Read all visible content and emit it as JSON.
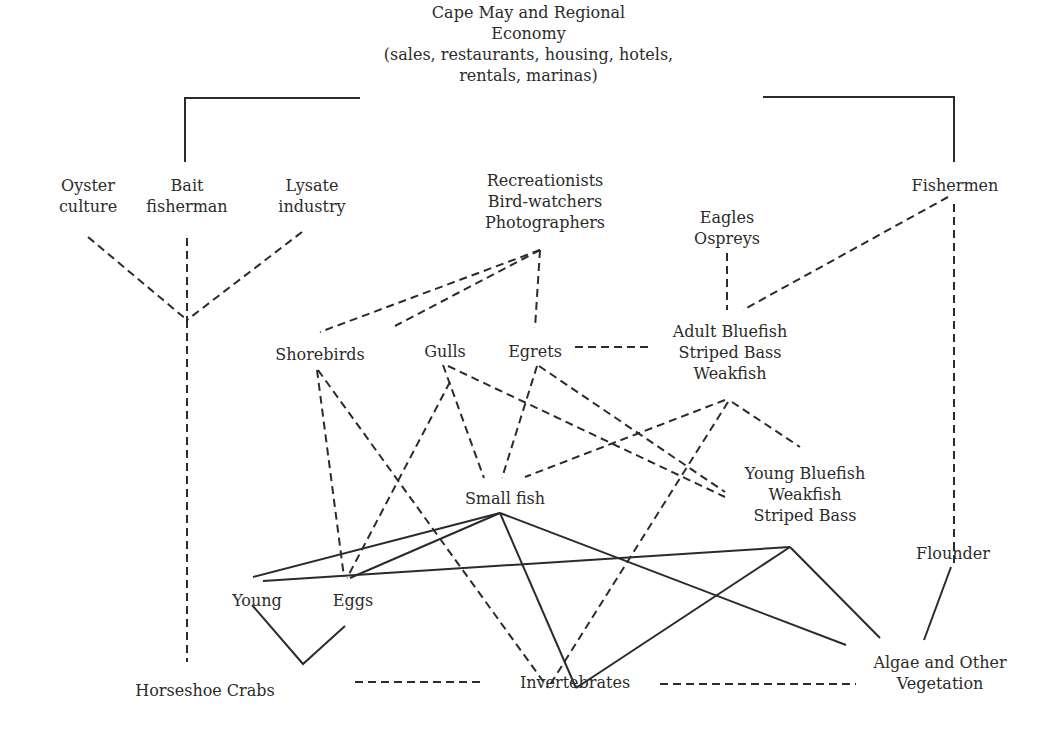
{
  "diagram": {
    "nodes": {
      "economy": {
        "lines": [
          "Cape May and Regional",
          "Economy",
          "(sales, restaurants, housing, hotels,",
          "rentals, marinas)"
        ]
      },
      "oyster": {
        "lines": [
          "Oyster",
          "culture"
        ]
      },
      "bait": {
        "lines": [
          "Bait",
          "fisherman"
        ]
      },
      "lysate": {
        "lines": [
          "Lysate",
          "industry"
        ]
      },
      "recreation": {
        "lines": [
          "Recreationists",
          "Bird-watchers",
          "Photographers"
        ]
      },
      "fishermen": {
        "lines": [
          "Fishermen"
        ]
      },
      "eagles": {
        "lines": [
          "Eagles",
          "Ospreys"
        ]
      },
      "shorebirds": {
        "lines": [
          "Shorebirds"
        ]
      },
      "gulls": {
        "lines": [
          "Gulls"
        ]
      },
      "egrets": {
        "lines": [
          "Egrets"
        ]
      },
      "adult_fish": {
        "lines": [
          "Adult Bluefish",
          "Striped Bass",
          "Weakfish"
        ]
      },
      "young_fish": {
        "lines": [
          "Young Bluefish",
          "Weakfish",
          "Striped Bass"
        ]
      },
      "small_fish": {
        "lines": [
          "Small fish"
        ]
      },
      "flounder": {
        "lines": [
          "Flounder"
        ]
      },
      "young": {
        "lines": [
          "Young"
        ]
      },
      "eggs": {
        "lines": [
          "Eggs"
        ]
      },
      "horseshoe": {
        "lines": [
          "Horseshoe Crabs"
        ]
      },
      "invertebrates": {
        "lines": [
          "Invertebrates"
        ]
      },
      "algae": {
        "lines": [
          "Algae and Other",
          "Vegetation"
        ]
      }
    },
    "edges": [
      {
        "type": "solid",
        "points": [
          [
            360,
            98
          ],
          [
            185,
            98
          ],
          [
            185,
            162
          ]
        ]
      },
      {
        "type": "solid",
        "points": [
          [
            763,
            97
          ],
          [
            954,
            97
          ],
          [
            954,
            162
          ]
        ]
      },
      {
        "type": "dash",
        "points": [
          [
            88,
            237
          ],
          [
            187,
            320
          ]
        ]
      },
      {
        "type": "dash",
        "points": [
          [
            187,
            238
          ],
          [
            187,
            320
          ]
        ]
      },
      {
        "type": "dash",
        "points": [
          [
            302,
            232
          ],
          [
            187,
            320
          ]
        ]
      },
      {
        "type": "dash",
        "points": [
          [
            187,
            320
          ],
          [
            187,
            662
          ]
        ]
      },
      {
        "type": "dash",
        "points": [
          [
            540,
            250
          ],
          [
            320,
            332
          ]
        ]
      },
      {
        "type": "dash",
        "points": [
          [
            540,
            250
          ],
          [
            395,
            326
          ]
        ]
      },
      {
        "type": "dash",
        "points": [
          [
            540,
            250
          ],
          [
            535,
            328
          ]
        ]
      },
      {
        "type": "dash",
        "points": [
          [
            727,
            253
          ],
          [
            727,
            310
          ]
        ]
      },
      {
        "type": "dash",
        "points": [
          [
            948,
            197
          ],
          [
            743,
            310
          ]
        ]
      },
      {
        "type": "dash",
        "points": [
          [
            954,
            204
          ],
          [
            954,
            568
          ]
        ]
      },
      {
        "type": "dash",
        "points": [
          [
            575,
            347
          ],
          [
            650,
            347
          ]
        ]
      },
      {
        "type": "dash",
        "points": [
          [
            317,
            370
          ],
          [
            344,
            577
          ]
        ]
      },
      {
        "type": "dash",
        "points": [
          [
            318,
            370
          ],
          [
            548,
            688
          ]
        ]
      },
      {
        "type": "dash",
        "points": [
          [
            450,
            382
          ],
          [
            347,
            578
          ]
        ]
      },
      {
        "type": "dash",
        "points": [
          [
            443,
            365
          ],
          [
            484,
            478
          ]
        ]
      },
      {
        "type": "dash",
        "points": [
          [
            448,
            366
          ],
          [
            725,
            497
          ]
        ]
      },
      {
        "type": "dash",
        "points": [
          [
            537,
            366
          ],
          [
            502,
            478
          ]
        ]
      },
      {
        "type": "dash",
        "points": [
          [
            539,
            366
          ],
          [
            725,
            492
          ]
        ]
      },
      {
        "type": "dash",
        "points": [
          [
            725,
            400
          ],
          [
            525,
            477
          ]
        ]
      },
      {
        "type": "dash",
        "points": [
          [
            728,
            402
          ],
          [
            548,
            688
          ]
        ]
      },
      {
        "type": "dash",
        "points": [
          [
            732,
            402
          ],
          [
            800,
            447
          ]
        ]
      },
      {
        "type": "solid",
        "points": [
          [
            500,
            513
          ],
          [
            253,
            577
          ]
        ]
      },
      {
        "type": "solid",
        "points": [
          [
            500,
            513
          ],
          [
            350,
            578
          ]
        ]
      },
      {
        "type": "solid",
        "points": [
          [
            500,
            513
          ],
          [
            576,
            688
          ]
        ]
      },
      {
        "type": "solid",
        "points": [
          [
            500,
            513
          ],
          [
            846,
            645
          ]
        ]
      },
      {
        "type": "solid",
        "points": [
          [
            263,
            581
          ],
          [
            790,
            547
          ]
        ]
      },
      {
        "type": "solid",
        "points": [
          [
            790,
            547
          ],
          [
            576,
            688
          ]
        ]
      },
      {
        "type": "solid",
        "points": [
          [
            790,
            547
          ],
          [
            880,
            638
          ]
        ]
      },
      {
        "type": "solid",
        "points": [
          [
            951,
            567
          ],
          [
            924,
            640
          ]
        ]
      },
      {
        "type": "solid",
        "points": [
          [
            252,
            605
          ],
          [
            303,
            664
          ],
          [
            345,
            626
          ]
        ]
      },
      {
        "type": "dash",
        "points": [
          [
            355,
            682
          ],
          [
            485,
            682
          ]
        ]
      },
      {
        "type": "dash",
        "points": [
          [
            660,
            684
          ],
          [
            856,
            684
          ]
        ]
      }
    ]
  }
}
